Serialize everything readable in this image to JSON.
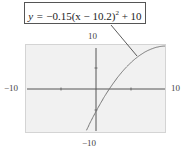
{
  "chart_data": {
    "type": "line",
    "equation": {
      "a": -0.15,
      "h": 10.2,
      "k": 10
    },
    "xlabel": "",
    "ylabel": "",
    "xlim": [
      -10,
      10
    ],
    "ylim": [
      -10,
      10
    ],
    "x_ticks": [
      -10,
      -5,
      0,
      5,
      10
    ],
    "y_ticks": [
      -10,
      -5,
      0,
      5,
      10
    ],
    "grid": false,
    "series": [
      {
        "name": "y = -0.15(x - 10.2)^2 + 10",
        "x": [
          -1.2,
          0,
          2,
          4,
          6,
          8,
          10
        ],
        "y": [
          -9.49,
          -5.61,
          -0.09,
          4.23,
          7.35,
          9.27,
          9.99
        ]
      }
    ],
    "annotations": [
      {
        "text": "y = -0.15(x - 10.2)^2 + 10",
        "points_to": [
          7.5,
          9.0
        ]
      }
    ]
  },
  "labels": {
    "equation_prefix": "y =",
    "equation_body": " −0.15(x − 10.2)",
    "equation_exp": "2",
    "equation_suffix": " + 10",
    "y_max": "10",
    "y_min": "−10",
    "x_min": "−10",
    "x_max": "10"
  }
}
